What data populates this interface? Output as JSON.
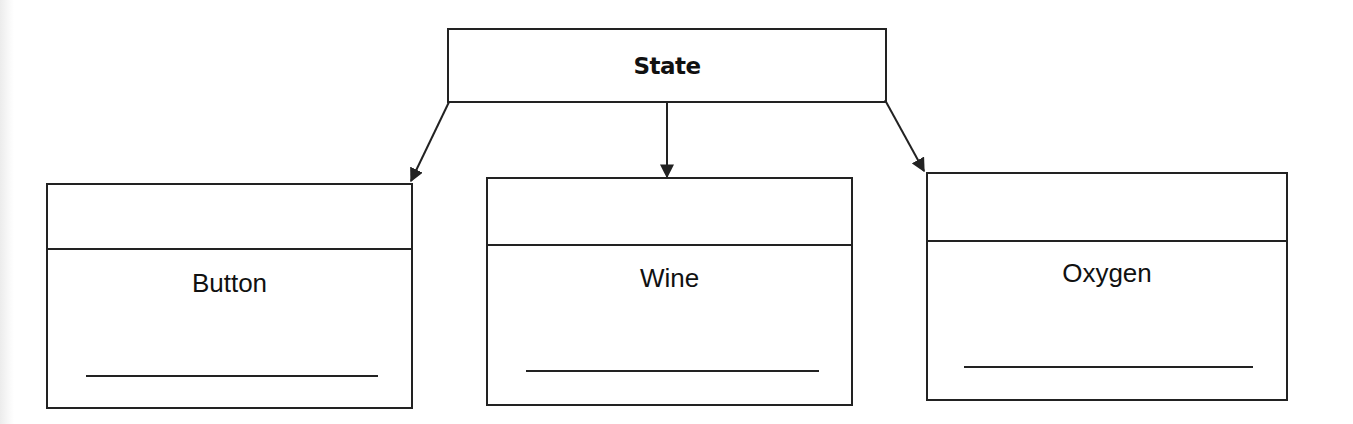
{
  "diagram": {
    "type": "class-hierarchy",
    "parent": {
      "label": "State"
    },
    "children": [
      {
        "label": "Button",
        "blank_line": ""
      },
      {
        "label": "Wine",
        "blank_line": ""
      },
      {
        "label": "Oxygen",
        "blank_line": ""
      }
    ],
    "edges": [
      {
        "from": "State",
        "to": "Button"
      },
      {
        "from": "State",
        "to": "Wine"
      },
      {
        "from": "State",
        "to": "Oxygen"
      }
    ],
    "colors": {
      "stroke": "#222222",
      "background": "#ffffff"
    }
  }
}
